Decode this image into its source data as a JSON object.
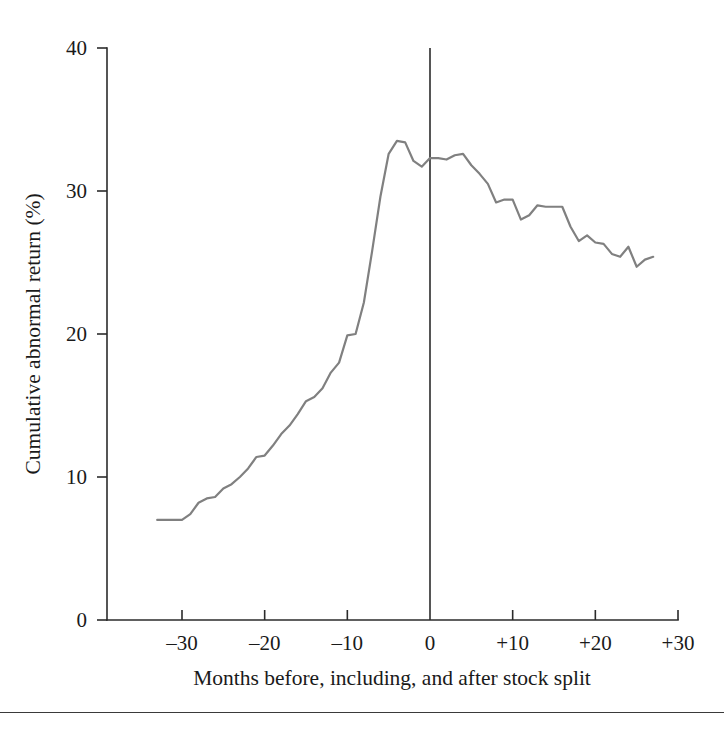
{
  "figure": {
    "background_color": "#ffffff",
    "axis_color": "#2b2b2b",
    "line_color": "#808080",
    "footer_rule_color": "#3a3a3a"
  },
  "chart_data": {
    "type": "line",
    "title": "",
    "subtitle": "",
    "xlabel": "Months before, including, and after stock split",
    "ylabel": "Cumulative abnormal return (%)",
    "xlim": [
      -36,
      30
    ],
    "ylim": [
      0,
      40
    ],
    "xticks": [
      -30,
      -20,
      -10,
      0,
      10,
      20,
      30
    ],
    "xtick_labels": [
      "–30",
      "–20",
      "–10",
      "0",
      "+10",
      "+20",
      "+30"
    ],
    "yticks": [
      0,
      10,
      20,
      30,
      40
    ],
    "ytick_labels": [
      "0",
      "10",
      "20",
      "30",
      "40"
    ],
    "grid": false,
    "legend": "none",
    "annotations": [
      {
        "name": "split-event-reference-line",
        "type": "vline",
        "x": 0,
        "label": ""
      }
    ],
    "series": [
      {
        "name": "Cumulative abnormal return",
        "color": "#808080",
        "x": [
          -33,
          -32,
          -31,
          -30,
          -29,
          -28,
          -27,
          -26,
          -25,
          -24,
          -23,
          -22,
          -21,
          -20,
          -19,
          -18,
          -17,
          -16,
          -15,
          -14,
          -13,
          -12,
          -11,
          -10,
          -9,
          -8,
          -7,
          -6,
          -5,
          -4,
          -3,
          -2,
          -1,
          0,
          1,
          2,
          3,
          4,
          5,
          6,
          7,
          8,
          9,
          10,
          11,
          12,
          13,
          14,
          15,
          16,
          17,
          18,
          19,
          20,
          21,
          22,
          23,
          24,
          25,
          26,
          27
        ],
        "values": [
          7.0,
          7.0,
          7.0,
          7.0,
          7.4,
          8.2,
          8.5,
          8.6,
          9.2,
          9.5,
          10.0,
          10.6,
          11.4,
          11.5,
          12.2,
          13.0,
          13.6,
          14.4,
          15.3,
          15.6,
          16.2,
          17.3,
          18.0,
          19.9,
          20.0,
          22.2,
          25.8,
          29.6,
          32.6,
          33.5,
          33.4,
          32.1,
          31.7,
          32.3,
          32.3,
          32.2,
          32.5,
          32.6,
          31.8,
          31.2,
          30.5,
          29.2,
          29.4,
          29.4,
          28.0,
          28.3,
          29.0,
          28.9,
          28.9,
          28.9,
          27.5,
          26.5,
          26.9,
          26.4,
          26.3,
          25.6,
          25.4,
          26.1,
          24.7,
          25.2,
          25.4
        ]
      }
    ]
  }
}
